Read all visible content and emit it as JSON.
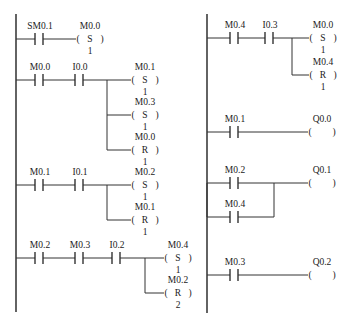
{
  "diagram": {
    "type": "ladder-logic",
    "colors": {
      "line": "#333333",
      "text": "#222222",
      "background": "#ffffff"
    },
    "rails": [
      {
        "x": 16,
        "y1": 14,
        "y2": 312
      },
      {
        "x": 207,
        "y1": 14,
        "y2": 313
      }
    ],
    "rungs": [
      {
        "id": "rung-1",
        "rail": 16,
        "y": 39,
        "contacts": [
          {
            "label": "SM0.1",
            "x": 40
          }
        ],
        "branch_x": null,
        "coils": [
          {
            "label": "M0.0",
            "type": "S",
            "count": "1",
            "x": 90,
            "y": 39
          }
        ]
      },
      {
        "id": "rung-2",
        "rail": 16,
        "y": 80,
        "contacts": [
          {
            "label": "M0.0",
            "x": 40
          },
          {
            "label": "I0.0",
            "x": 80
          }
        ],
        "branch_x": 107,
        "coils": [
          {
            "label": "M0.1",
            "type": "S",
            "count": "1",
            "x": 145,
            "y": 80
          },
          {
            "label": "M0.3",
            "type": "S",
            "count": "1",
            "x": 145,
            "y": 115
          },
          {
            "label": "M0.0",
            "type": "R",
            "count": "1",
            "x": 145,
            "y": 150
          }
        ]
      },
      {
        "id": "rung-3",
        "rail": 16,
        "y": 185,
        "contacts": [
          {
            "label": "M0.1",
            "x": 40
          },
          {
            "label": "I0.1",
            "x": 80
          }
        ],
        "branch_x": 107,
        "coils": [
          {
            "label": "M0.2",
            "type": "S",
            "count": "1",
            "x": 145,
            "y": 185
          },
          {
            "label": "M0.1",
            "type": "R",
            "count": "1",
            "x": 145,
            "y": 220
          }
        ]
      },
      {
        "id": "rung-4",
        "rail": 16,
        "y": 258,
        "contacts": [
          {
            "label": "M0.2",
            "x": 40
          },
          {
            "label": "M0.3",
            "x": 80
          },
          {
            "label": "I0.2",
            "x": 117
          }
        ],
        "branch_x": 145,
        "coils": [
          {
            "label": "M0.4",
            "type": "S",
            "count": "1",
            "x": 178,
            "y": 258
          },
          {
            "label": "M0.2",
            "type": "R",
            "count": "2",
            "x": 178,
            "y": 293
          }
        ]
      },
      {
        "id": "rung-5",
        "rail": 207,
        "y": 38,
        "contacts": [
          {
            "label": "M0.4",
            "x": 235
          },
          {
            "label": "I0.3",
            "x": 270
          }
        ],
        "branch_x": 292,
        "coils": [
          {
            "label": "M0.0",
            "type": "S",
            "count": "1",
            "x": 323,
            "y": 38
          },
          {
            "label": "M0.4",
            "type": "R",
            "count": "1",
            "x": 323,
            "y": 75
          }
        ]
      },
      {
        "id": "rung-6",
        "rail": 207,
        "y": 132,
        "contacts": [
          {
            "label": "M0.1",
            "x": 235
          }
        ],
        "branch_x": null,
        "coils": [
          {
            "label": "Q0.0",
            "type": "",
            "count": "",
            "x": 322,
            "y": 132
          }
        ]
      },
      {
        "id": "rung-7",
        "rail": 207,
        "y": 183,
        "contacts": [
          {
            "label": "M0.2",
            "x": 235
          }
        ],
        "parallel": {
          "label": "M0.4",
          "x": 235,
          "y": 217,
          "join_x": 274
        },
        "branch_x": null,
        "coils": [
          {
            "label": "Q0.1",
            "type": "",
            "count": "",
            "x": 322,
            "y": 183
          }
        ]
      },
      {
        "id": "rung-8",
        "rail": 207,
        "y": 275,
        "contacts": [
          {
            "label": "M0.3",
            "x": 235
          }
        ],
        "branch_x": null,
        "coils": [
          {
            "label": "Q0.2",
            "type": "",
            "count": "",
            "x": 322,
            "y": 275
          }
        ]
      }
    ]
  }
}
